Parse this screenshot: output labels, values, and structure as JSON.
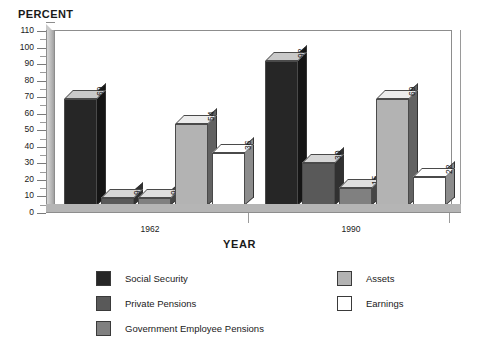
{
  "chart_data": {
    "type": "bar",
    "title": "",
    "ylabel": "PERCENT",
    "xlabel": "YEAR",
    "categories": [
      "1962",
      "1990"
    ],
    "ylim": [
      0,
      110
    ],
    "yticks": [
      0,
      10,
      20,
      30,
      40,
      50,
      60,
      70,
      80,
      90,
      100,
      110
    ],
    "minor_tick_step": 5,
    "grid": false,
    "legend_position": "bottom",
    "series": [
      {
        "name": "Social Security",
        "color": "#262626",
        "values": [
          69,
          92
        ]
      },
      {
        "name": "Private Pensions",
        "color": "#595959",
        "values": [
          9,
          30
        ]
      },
      {
        "name": "Government Employee Pensions",
        "color": "#808080",
        "values": [
          9,
          15
        ]
      },
      {
        "name": "Assets",
        "color": "#b3b3b3",
        "values": [
          54,
          69
        ]
      },
      {
        "name": "Earnings",
        "color": "#ffffff",
        "values": [
          36,
          22
        ]
      }
    ]
  },
  "axes": {
    "y_title": "PERCENT",
    "x_title": "YEAR",
    "y_tick_labels": [
      "110",
      "100",
      "90",
      "80",
      "70",
      "60",
      "50",
      "40",
      "30",
      "20",
      "10",
      "0"
    ],
    "x_tick_labels": [
      "1962",
      "1990"
    ]
  },
  "legend": {
    "left_column": [
      {
        "label": "Social Security",
        "color": "#262626"
      },
      {
        "label": "Private Pensions",
        "color": "#595959"
      },
      {
        "label": "Government Employee Pensions",
        "color": "#808080"
      }
    ],
    "right_column": [
      {
        "label": "Assets",
        "color": "#b3b3b3"
      },
      {
        "label": "Earnings",
        "color": "#ffffff"
      }
    ]
  },
  "bar_labels": {
    "g1": [
      "69",
      "9",
      "9",
      "54",
      "36"
    ],
    "g2": [
      "92",
      "30",
      "15",
      "69",
      "22"
    ]
  }
}
